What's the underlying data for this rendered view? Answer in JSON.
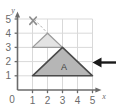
{
  "figure": {
    "background_color": "#ffffff",
    "grid": {
      "show": true,
      "color": "#d8d8d8",
      "x_min": 0,
      "x_max": 5,
      "y_min": 0,
      "y_max": 5,
      "step": 1
    },
    "axes": {
      "color": "#6b6b6b",
      "x_label": "x",
      "y_label": "y",
      "origin_label": "0",
      "x_ticks": [
        "1",
        "2",
        "3",
        "4",
        "5"
      ],
      "y_ticks": [
        "1",
        "2",
        "3",
        "4",
        "5"
      ]
    },
    "shapes": [
      {
        "name": "small-triangle",
        "label": "",
        "points": [
          [
            1,
            3
          ],
          [
            3,
            3
          ],
          [
            2,
            4
          ]
        ],
        "fill": "#e2e2e2",
        "stroke": "#9a9a9a"
      },
      {
        "name": "large-triangle",
        "label": "A",
        "points": [
          [
            1,
            1
          ],
          [
            5,
            1
          ],
          [
            3,
            3
          ]
        ],
        "fill": "#b5b5b5",
        "stroke": "#4a4a4a",
        "label_position": [
          3.1,
          1.85
        ]
      }
    ],
    "markers": [
      {
        "name": "centre-of-enlargement",
        "glyph": "x-mark",
        "position": [
          1.45,
          5.05
        ],
        "color": "#8d8d8d"
      }
    ],
    "construction_lines": [
      {
        "name": "ray-from-centre",
        "from": [
          1.45,
          5.05
        ],
        "to": [
          3.1,
          2.95
        ],
        "style": "dashed",
        "color": "#a9a9a9"
      }
    ],
    "annotations": [
      {
        "name": "pointer-arrow",
        "direction": "left",
        "color": "#1a1a1a",
        "y_position": 2.3
      }
    ]
  }
}
